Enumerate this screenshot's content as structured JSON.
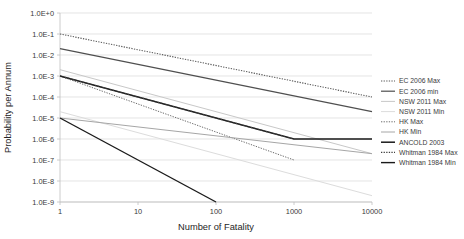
{
  "chart_data": {
    "type": "line",
    "title": "",
    "xlabel": "Number of Fatality",
    "ylabel": "Probability per Annum",
    "xscale": "log",
    "yscale": "log",
    "xlim": [
      1,
      10000
    ],
    "ylim": [
      1e-09,
      1
    ],
    "grid": true,
    "legend_position": "right",
    "xticks": [
      "1",
      "10",
      "100",
      "1000",
      "10000"
    ],
    "xtick_values": [
      1,
      10,
      100,
      1000,
      10000
    ],
    "yticks": [
      "1.0E+0",
      "1.0E-1",
      "1.0E-2",
      "1.0E-3",
      "1.0E-4",
      "1.0E-5",
      "1.0E-6",
      "1.0E-7",
      "1.0E-8",
      "1.0E-9"
    ],
    "ytick_values": [
      1,
      0.1,
      0.01,
      0.001,
      0.0001,
      1e-05,
      1e-06,
      1e-07,
      1e-08,
      1e-09
    ],
    "series": [
      {
        "name": "EC 2006 Max",
        "style": "dotted",
        "color": "#595959",
        "width": 1.1,
        "x": [
          1,
          10000
        ],
        "y": [
          0.1,
          0.0001
        ]
      },
      {
        "name": "EC 2006 min",
        "style": "solid",
        "color": "#4f4f4f",
        "width": 1.2,
        "x": [
          1,
          10000
        ],
        "y": [
          0.02,
          2e-05
        ]
      },
      {
        "name": "NSW 2011 Max",
        "style": "solid",
        "color": "#c8c8c8",
        "width": 1.0,
        "x": [
          1,
          10000
        ],
        "y": [
          0.002,
          2e-07
        ]
      },
      {
        "name": "NSW 2011 Min",
        "style": "solid",
        "color": "#dcdcdc",
        "width": 1.0,
        "x": [
          1,
          10000
        ],
        "y": [
          2e-05,
          2e-09
        ]
      },
      {
        "name": "HK Max",
        "style": "dotted",
        "color": "#6b6b6b",
        "width": 1.0,
        "x": [
          1,
          1000
        ],
        "y": [
          0.001,
          1e-07
        ]
      },
      {
        "name": "HK Min",
        "style": "solid",
        "color": "#a6a6a6",
        "width": 1.0,
        "x": [
          1,
          10000
        ],
        "y": [
          1e-05,
          2e-07
        ]
      },
      {
        "name": "ANCOLD 2003",
        "style": "solid",
        "color": "#1a1a1a",
        "width": 1.5,
        "x": [
          1,
          1000,
          10000
        ],
        "y": [
          0.001,
          1e-06,
          1e-06
        ]
      },
      {
        "name": "Whitman 1984 Max",
        "style": "dotted",
        "color": "#404040",
        "width": 1.1,
        "x": [
          1,
          1000
        ],
        "y": [
          0.001,
          1e-06
        ]
      },
      {
        "name": "Whitman 1984 Min",
        "style": "solid",
        "color": "#1a1a1a",
        "width": 1.4,
        "x": [
          1,
          100
        ],
        "y": [
          1e-05,
          1e-09
        ]
      }
    ]
  },
  "legend": {
    "items": [
      {
        "label": "EC 2006 Max"
      },
      {
        "label": "EC 2006 min"
      },
      {
        "label": "NSW 2011 Max"
      },
      {
        "label": "NSW 2011 Min"
      },
      {
        "label": "HK Max"
      },
      {
        "label": "HK Min"
      },
      {
        "label": "ANCOLD 2003"
      },
      {
        "label": "Whitman 1984 Max"
      },
      {
        "label": "Whitman 1984 Min"
      }
    ]
  }
}
